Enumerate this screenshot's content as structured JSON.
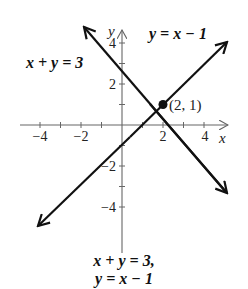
{
  "figure": {
    "type": "coordinate-graph",
    "axes": {
      "x_label": "x",
      "y_label": "y",
      "x_ticks": [
        -4,
        -3,
        -2,
        -1,
        1,
        2,
        3,
        4
      ],
      "y_ticks": [
        -4,
        -3,
        -2,
        -1,
        1,
        2,
        3,
        4
      ],
      "x_tick_labels": [
        "−4",
        "−2",
        "2",
        "4"
      ],
      "y_tick_labels": [
        "4",
        "2",
        "−2",
        "−4"
      ]
    },
    "lines": [
      {
        "label": "x + y = 3",
        "equation": "y = 3 - x",
        "slope": -1,
        "intercept": 3
      },
      {
        "label": "y = x − 1",
        "equation": "y = x - 1",
        "slope": 1,
        "intercept": -1
      }
    ],
    "intersection": {
      "label": "(2, 1)",
      "x": 2,
      "y": 1
    },
    "caption": {
      "line1": "x + y = 3,",
      "line2": "y = x − 1"
    },
    "colors": {
      "line": "#111111",
      "axis": "#555555",
      "background": "#ffffff"
    }
  }
}
